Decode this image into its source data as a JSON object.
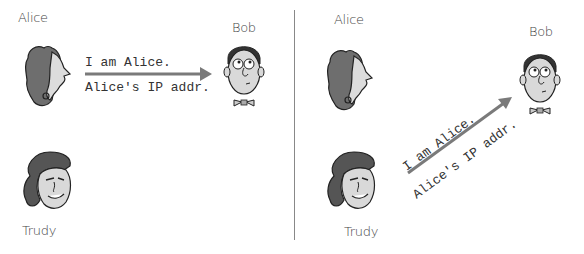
{
  "left_panel": {
    "alice_label": "Alice",
    "bob_label": "Bob",
    "trudy_label": "Trudy",
    "message_line1": "I am Alice.",
    "message_line2": "Alice's IP addr."
  },
  "right_panel": {
    "alice_label": "Alice",
    "bob_label": "Bob",
    "trudy_label": "Trudy",
    "message_line1": "I am Alice.",
    "message_line2": "Alice's IP addr."
  },
  "colors": {
    "arrow": "#7a7a7a",
    "hair_dark": "#6e6e6e",
    "skin": "#d9d9d9",
    "divider": "#888888"
  }
}
